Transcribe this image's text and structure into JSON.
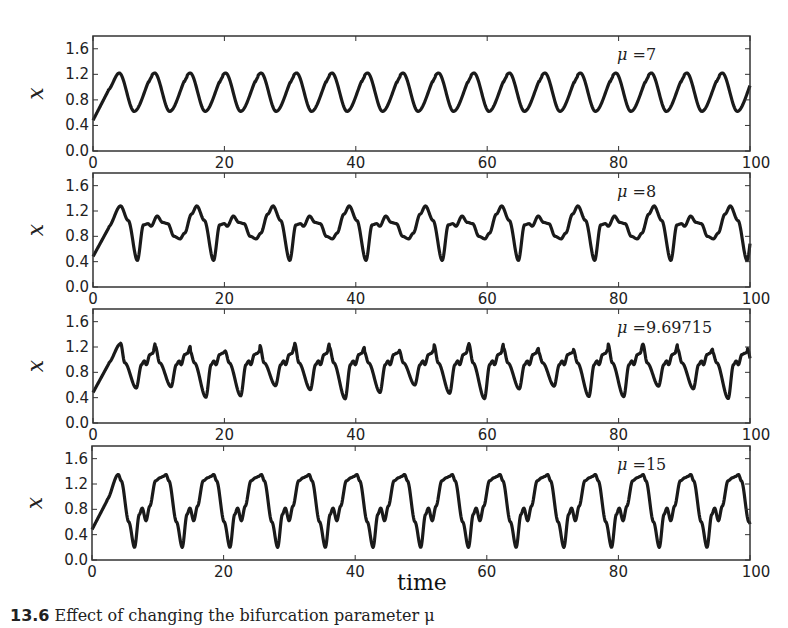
{
  "chart_data": [
    {
      "type": "line",
      "annotation": "μ =7",
      "mu": "7",
      "xlabel": "",
      "ylabel": "x",
      "xlim": [
        0,
        100
      ],
      "ylim": [
        0.0,
        1.8
      ],
      "xticks": [
        "0",
        "20",
        "40",
        "60",
        "80",
        "100"
      ],
      "yticks": [
        "0.0",
        "0.4",
        "0.8",
        "1.2",
        "1.6"
      ],
      "grid": false,
      "series": [
        {
          "name": "x(t)",
          "pattern": "regular oscillation",
          "start_value": 0.48,
          "period": 5.4,
          "first_peak_t": 4.0,
          "peak_value": 1.22,
          "trough_value": 0.62
        }
      ]
    },
    {
      "type": "line",
      "annotation": "μ =8",
      "mu": "8",
      "xlabel": "",
      "ylabel": "x",
      "xlim": [
        0,
        100
      ],
      "ylim": [
        0.0,
        1.8
      ],
      "xticks": [
        "0",
        "20",
        "40",
        "60",
        "80",
        "100"
      ],
      "yticks": [
        "0.0",
        "0.4",
        "0.8",
        "1.2",
        "1.6"
      ],
      "grid": false,
      "series": [
        {
          "name": "x(t)",
          "pattern": "period-2 oscillation",
          "start_value": 0.48,
          "period": 11.6,
          "first_peak_t": 4.2,
          "peak_value": 1.28,
          "trough_value": 0.42,
          "secondary_peak": 1.12,
          "secondary_trough": 0.76
        }
      ]
    },
    {
      "type": "line",
      "annotation": "μ =9.69715",
      "mu": "9.69715",
      "xlabel": "",
      "ylabel": "x",
      "xlim": [
        0,
        100
      ],
      "ylim": [
        0.0,
        1.8
      ],
      "xticks": [
        "0",
        "20",
        "40",
        "60",
        "80",
        "100"
      ],
      "yticks": [
        "0.0",
        "0.4",
        "0.8",
        "1.2",
        "1.6"
      ],
      "grid": false,
      "series": [
        {
          "name": "x(t)",
          "pattern": "irregular (chaotic) oscillation",
          "start_value": 0.48,
          "period": 5.3,
          "first_peak_t": 4.2,
          "peak_value": 1.25,
          "trough_value": 0.4,
          "secondary_peak": 1.15,
          "secondary_trough": 0.6
        }
      ]
    },
    {
      "type": "line",
      "annotation": "μ =15",
      "mu": "15",
      "xlabel": "time",
      "ylabel": "x",
      "xlim": [
        0,
        100
      ],
      "ylim": [
        0.0,
        1.8
      ],
      "xticks": [
        "0",
        "20",
        "40",
        "60",
        "80",
        "100"
      ],
      "yticks": [
        "0.0",
        "0.4",
        "0.8",
        "1.2",
        "1.6"
      ],
      "grid": false,
      "series": [
        {
          "name": "x(t)",
          "pattern": "relaxation-like oscillation with shoulder",
          "start_value": 0.48,
          "period": 7.25,
          "first_peak_t": 4.0,
          "peak_value": 1.35,
          "trough_value": 0.2,
          "shoulder_peak": 0.82,
          "shoulder_trough": 0.62
        }
      ]
    }
  ],
  "figure": {
    "xlabel": "time",
    "caption": "13.6  Effect of changing the bifurcation parameter μ"
  }
}
